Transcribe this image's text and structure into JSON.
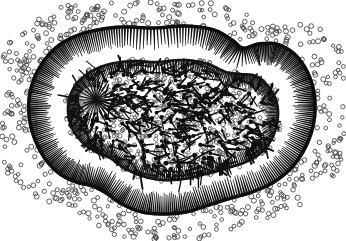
{
  "figure": {
    "title": "Cross-section of a ciliated spherical organism",
    "caption": "",
    "background_color": "#ffffff",
    "ink_color": "#101010",
    "mid_ink_color": "#3a3a3a",
    "granule_stroke_color": "#4a4a4a",
    "width": 346,
    "height": 241,
    "style": "black-and-white line engraving / stipple halftone"
  },
  "chart_data": {
    "type": "diagram",
    "title": "Cross-section of a ciliated spherical organism",
    "xlabel": "",
    "ylabel": "",
    "grid": false,
    "legend": "none",
    "layers": [
      {
        "name": "outer-granule-halo",
        "label": "Scattered external granules",
        "shape": "open-circles",
        "count": 520,
        "radius_px": 2.1,
        "stroke_width": 0.9,
        "color": "#4a4a4a",
        "band_inner_offset": 2,
        "band_outer_offset": 46
      },
      {
        "name": "outer-membrane",
        "label": "Outer membrane wall",
        "shape": "closed-irregular-lobed-curve",
        "stroke_width": 3.4,
        "color": "#0d0d0d"
      },
      {
        "name": "outer-cilia",
        "label": "Inward radiating cilia of outer wall",
        "shape": "radial-tapered-bars",
        "count": 235,
        "length_px": 20,
        "stroke_width": 1.9,
        "color": "#121212"
      },
      {
        "name": "inner-membrane",
        "label": "Inner membrane wall",
        "shape": "closed-irregular-lobed-curve",
        "stroke_width": 2.6,
        "color": "#141414",
        "scale_of_outer": 0.66
      },
      {
        "name": "inner-cilia",
        "label": "Inward radiating cilia of inner wall",
        "shape": "radial-tapered-bars",
        "count": 190,
        "length_px": 13,
        "stroke_width": 1.7,
        "color": "#161616"
      },
      {
        "name": "core-medulla",
        "label": "Dense core of pin-shaped spicules",
        "shape": "pin-rods",
        "count": 430,
        "rod_length_px": 13,
        "head_radius_px": 2.0,
        "color": "#101010"
      },
      {
        "name": "core-granules",
        "label": "Interstitial granules of the core",
        "shape": "open-circles",
        "count": 780,
        "radius_px": 1.9,
        "color": "#555555"
      },
      {
        "name": "radiating-focus",
        "label": "Left-lobe radiating focal point",
        "shape": "starburst",
        "center_x": 96,
        "center_y": 100,
        "ray_count": 26,
        "ray_length_px": 26,
        "color": "#111111"
      }
    ],
    "outer_outline_points": [
      [
        154,
        28
      ],
      [
        186,
        26
      ],
      [
        214,
        30
      ],
      [
        232,
        40
      ],
      [
        243,
        48
      ],
      [
        258,
        44
      ],
      [
        276,
        44
      ],
      [
        292,
        52
      ],
      [
        304,
        66
      ],
      [
        312,
        84
      ],
      [
        315,
        104
      ],
      [
        313,
        126
      ],
      [
        305,
        148
      ],
      [
        292,
        167
      ],
      [
        274,
        182
      ],
      [
        252,
        192
      ],
      [
        228,
        199
      ],
      [
        206,
        206
      ],
      [
        186,
        212
      ],
      [
        164,
        214
      ],
      [
        142,
        212
      ],
      [
        122,
        204
      ],
      [
        106,
        193
      ],
      [
        92,
        186
      ],
      [
        76,
        182
      ],
      [
        60,
        174
      ],
      [
        46,
        160
      ],
      [
        36,
        142
      ],
      [
        30,
        122
      ],
      [
        29,
        100
      ],
      [
        34,
        79
      ],
      [
        44,
        61
      ],
      [
        58,
        46
      ],
      [
        76,
        36
      ],
      [
        97,
        30
      ],
      [
        122,
        27
      ]
    ],
    "inner_outline_points": [
      [
        156,
        62
      ],
      [
        184,
        60
      ],
      [
        208,
        64
      ],
      [
        226,
        72
      ],
      [
        240,
        74
      ],
      [
        256,
        76
      ],
      [
        268,
        86
      ],
      [
        276,
        100
      ],
      [
        278,
        116
      ],
      [
        274,
        134
      ],
      [
        264,
        150
      ],
      [
        248,
        161
      ],
      [
        228,
        168
      ],
      [
        206,
        174
      ],
      [
        184,
        179
      ],
      [
        162,
        180
      ],
      [
        142,
        176
      ],
      [
        124,
        168
      ],
      [
        110,
        158
      ],
      [
        96,
        152
      ],
      [
        82,
        142
      ],
      [
        72,
        128
      ],
      [
        68,
        112
      ],
      [
        70,
        96
      ],
      [
        78,
        82
      ],
      [
        92,
        71
      ],
      [
        110,
        64
      ],
      [
        132,
        61
      ]
    ]
  }
}
